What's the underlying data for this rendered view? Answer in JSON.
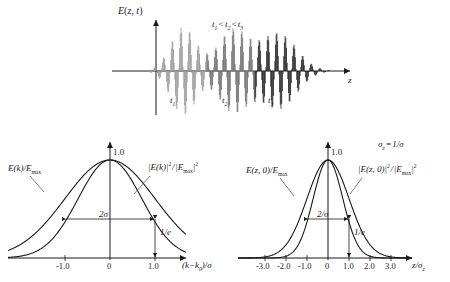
{
  "figure": {
    "background": "#ffffff",
    "ink": "#1a1a1a"
  },
  "top_panel": {
    "yaxis_label": "E(z, t)",
    "xaxis_label": "z",
    "time_ordering_note": "t1 < t2 < t3",
    "packet_labels": [
      "t1",
      "t2",
      "t3"
    ],
    "packet_colors": [
      "#9a9a9a",
      "#6e6e6e",
      "#222222"
    ],
    "chart_data": {
      "type": "line",
      "title": "Gaussian wave packet spreading in time",
      "xlabel": "z",
      "ylabel": "E(z, t)",
      "annotation": "t1 < t2 < t3",
      "series": [
        {
          "name": "t1",
          "center": -0.42,
          "envelope_sigma": 0.115,
          "amplitude": 1.0,
          "carrier_cycles": 26,
          "color": "#9a9a9a"
        },
        {
          "name": "t2",
          "center": 0.02,
          "envelope_sigma": 0.135,
          "amplitude": 0.93,
          "carrier_cycles": 26,
          "color": "#6e6e6e"
        },
        {
          "name": "t3",
          "center": 0.42,
          "envelope_sigma": 0.16,
          "amplitude": 0.86,
          "carrier_cycles": 26,
          "color": "#222222"
        }
      ],
      "grid": false,
      "legend": "none"
    }
  },
  "left_panel": {
    "curve_label_field": "E(k)/Emax",
    "curve_label_intensity": "|E(k)|^2 / |Emax|^2",
    "xaxis_label": "(k - k0)/sigma",
    "peak_label": "1.0",
    "width_annotation": "2σ",
    "height_annotation": "1/e",
    "xticks": [
      "-1.0",
      "0",
      "1.0"
    ],
    "chart_data": {
      "type": "line",
      "title": "Spectral amplitude and intensity of a Gaussian pulse",
      "xlabel": "(k - k0)/σ",
      "ylabel": "",
      "xlim": [
        -2.4,
        2.4
      ],
      "ylim": [
        0,
        1.12
      ],
      "xticks": [
        -1.0,
        0,
        1.0
      ],
      "xticklabels": [
        "-1.0",
        "0",
        "1.0"
      ],
      "peak_value": 1.0,
      "grid": false,
      "legend": "inline-labels",
      "series": [
        {
          "name": "E(k)/Emax",
          "formula": "exp(-x^2/2)",
          "x": [
            -2.4,
            -2.0,
            -1.6,
            -1.2,
            -1.0,
            -0.8,
            -0.4,
            0,
            0.4,
            0.8,
            1.0,
            1.2,
            1.6,
            2.0,
            2.4
          ],
          "y": [
            0.056,
            0.135,
            0.278,
            0.487,
            0.607,
            0.726,
            0.923,
            1.0,
            0.923,
            0.726,
            0.607,
            0.487,
            0.278,
            0.135,
            0.056
          ]
        },
        {
          "name": "|E(k)|^2/|Emax|^2",
          "formula": "exp(-x^2)",
          "x": [
            -2.4,
            -2.0,
            -1.6,
            -1.2,
            -1.0,
            -0.8,
            -0.4,
            0,
            0.4,
            0.8,
            1.0,
            1.2,
            1.6,
            2.0,
            2.4
          ],
          "y": [
            0.003,
            0.018,
            0.077,
            0.237,
            0.368,
            0.527,
            0.852,
            1.0,
            0.852,
            0.527,
            0.368,
            0.237,
            0.077,
            0.018,
            0.003
          ]
        }
      ],
      "annotations": [
        {
          "text": "2σ",
          "type": "double-arrow",
          "from_x": -1.0,
          "to_x": 1.0,
          "at_y": 0.368
        },
        {
          "text": "1/e",
          "type": "vertical-arrow",
          "at_x": 1.0,
          "from_y": 0.368,
          "to_y": 0.0
        }
      ]
    }
  },
  "right_panel": {
    "curve_label_field": "E(z, 0)/Emax",
    "curve_label_intensity": "|E(z, 0)|^2 / |Emax|^2",
    "xaxis_label": "z/sigma_z",
    "peak_label": "1.0",
    "width_annotation": "2/σ",
    "height_annotation": "1/e",
    "relation_note": "sigma_z = 1/sigma",
    "xticks": [
      "-3.0",
      "-2.0",
      "-1.0",
      "0",
      "1.0",
      "2.0",
      "3.0"
    ],
    "chart_data": {
      "type": "line",
      "title": "Spatial amplitude and intensity of a Gaussian pulse",
      "xlabel": "z/σz",
      "ylabel": "",
      "xlim": [
        -3.9,
        3.9
      ],
      "ylim": [
        0,
        1.12
      ],
      "xticks": [
        -3.0,
        -2.0,
        -1.0,
        0,
        1.0,
        2.0,
        3.0
      ],
      "xticklabels": [
        "-3.0",
        "-2.0",
        "-1.0",
        "0",
        "1.0",
        "2.0",
        "3.0"
      ],
      "peak_value": 1.0,
      "annotation": "σz = 1/σ",
      "grid": false,
      "legend": "inline-labels",
      "series": [
        {
          "name": "E(z, 0)/Emax",
          "formula": "exp(-x^2/2)",
          "x": [
            -3.5,
            -3.0,
            -2.5,
            -2.0,
            -1.5,
            -1.0,
            -0.5,
            0,
            0.5,
            1.0,
            1.5,
            2.0,
            2.5,
            3.0,
            3.5
          ],
          "y": [
            0.002,
            0.011,
            0.044,
            0.135,
            0.325,
            0.607,
            0.882,
            1.0,
            0.882,
            0.607,
            0.325,
            0.135,
            0.044,
            0.011,
            0.002
          ]
        },
        {
          "name": "|E(z, 0)|^2/|Emax|^2",
          "formula": "exp(-x^2)",
          "x": [
            -3.5,
            -3.0,
            -2.5,
            -2.0,
            -1.5,
            -1.0,
            -0.5,
            0,
            0.5,
            1.0,
            1.5,
            2.0,
            2.5,
            3.0,
            3.5
          ],
          "y": [
            0.0,
            0.0001,
            0.002,
            0.018,
            0.105,
            0.368,
            0.779,
            1.0,
            0.779,
            0.368,
            0.105,
            0.018,
            0.002,
            0.0001,
            0.0
          ]
        }
      ],
      "annotations": [
        {
          "text": "2/σ",
          "type": "double-arrow",
          "from_x": -1.0,
          "to_x": 1.0,
          "at_y": 0.368
        },
        {
          "text": "1/e",
          "type": "vertical-arrow",
          "at_x": 1.0,
          "from_y": 0.368,
          "to_y": 0.0
        }
      ]
    }
  }
}
